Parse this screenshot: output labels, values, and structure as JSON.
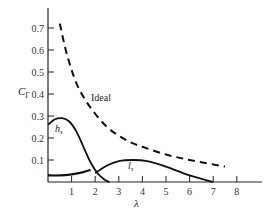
{
  "chart_data": {
    "type": "line",
    "title": "",
    "xlabel": "λ",
    "ylabel": "C_Γ",
    "xlim": [
      0,
      9
    ],
    "ylim": [
      0,
      0.75
    ],
    "grid": false,
    "x_ticks": [
      "1",
      "2",
      "3",
      "4",
      "5",
      "6",
      "7",
      "8"
    ],
    "y_ticks": [
      "0.1",
      "0.2",
      "0.3",
      "0.4",
      "0.5",
      "0.6",
      "0.7"
    ],
    "series": [
      {
        "name": "Ideal",
        "style": "dashed",
        "x": [
          0.5,
          0.8,
          1.2,
          1.6,
          2.0,
          2.5,
          3.0,
          3.5,
          4.0,
          5.0,
          6.0,
          7.0,
          7.5
        ],
        "values": [
          0.72,
          0.58,
          0.45,
          0.37,
          0.31,
          0.25,
          0.21,
          0.18,
          0.16,
          0.125,
          0.1,
          0.08,
          0.07
        ]
      },
      {
        "name": "h_s",
        "style": "solid",
        "x": [
          0,
          0.3,
          0.6,
          0.9,
          1.2,
          1.5,
          1.8,
          2.1,
          2.4,
          2.6
        ],
        "values": [
          0.26,
          0.285,
          0.29,
          0.275,
          0.23,
          0.16,
          0.09,
          0.04,
          0.01,
          0.0
        ]
      },
      {
        "name": "l_s",
        "style": "solid",
        "segments": [
          {
            "x": [
              0,
              0.5,
              1.0,
              1.5,
              1.8
            ],
            "values": [
              0.03,
              0.03,
              0.035,
              0.045,
              0.055
            ]
          },
          {
            "x": [
              2.0,
              2.5,
              3.0,
              3.6,
              4.2,
              5.0,
              6.0,
              7.0
            ],
            "values": [
              0.04,
              0.075,
              0.095,
              0.1,
              0.095,
              0.07,
              0.03,
              0.0
            ]
          }
        ]
      }
    ],
    "annotations": [
      {
        "text": "Ideal",
        "x": 1.9,
        "y": 0.4
      },
      {
        "text": "h_s",
        "x": 0.3,
        "y": 0.22
      },
      {
        "text": "l_s",
        "x": 4.2,
        "y": 0.06
      }
    ]
  },
  "labels": {
    "ylabel_main": "C",
    "ylabel_sub": "Γ",
    "xlabel": "λ",
    "ideal": "Ideal",
    "hs_main": "h",
    "hs_sub": "s",
    "ls_main": "l",
    "ls_sub": "s"
  }
}
